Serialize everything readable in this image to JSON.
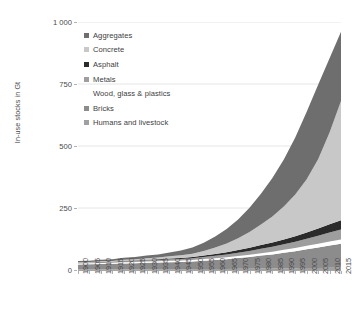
{
  "chart_data": {
    "type": "area",
    "stacked": true,
    "title": "",
    "xlabel": "",
    "ylabel": "In-use stocks in Gt",
    "ylim": [
      0,
      1000
    ],
    "yticks": [
      0,
      250,
      500,
      750,
      1000
    ],
    "ytick_labels": [
      "0",
      "250",
      "500",
      "750",
      "1 000"
    ],
    "grid": true,
    "legend_position": "upper-left-inside",
    "x": [
      1900,
      1905,
      1910,
      1915,
      1920,
      1925,
      1930,
      1935,
      1940,
      1945,
      1950,
      1955,
      1960,
      1965,
      1970,
      1975,
      1980,
      1985,
      1990,
      1995,
      2000,
      2005,
      2010,
      2015
    ],
    "xtick_labels": [
      "1900",
      "1905",
      "1910",
      "1915",
      "1920",
      "1925",
      "1930",
      "1935",
      "1940",
      "1945",
      "1950",
      "1955",
      "1960",
      "1965",
      "1970",
      "1975",
      "1980",
      "1985",
      "1990",
      "1995",
      "2000",
      "2005",
      "2010",
      "2015"
    ],
    "series": [
      {
        "name": "Humans and livestock",
        "color": "#a0a0a0",
        "values": [
          2,
          2,
          2,
          2,
          2,
          2,
          3,
          3,
          3,
          3,
          3,
          4,
          4,
          4,
          5,
          5,
          6,
          6,
          7,
          7,
          8,
          8,
          9,
          9
        ]
      },
      {
        "name": "Bricks",
        "color": "#8c8c8c",
        "values": [
          20,
          21,
          22,
          23,
          24,
          25,
          26,
          27,
          28,
          29,
          31,
          33,
          36,
          39,
          43,
          47,
          52,
          57,
          63,
          69,
          76,
          83,
          90,
          97
        ]
      },
      {
        "name": "Wood, glass & plastics",
        "color": "#ffffff",
        "values": [
          4,
          4,
          4,
          4,
          5,
          5,
          5,
          5,
          6,
          6,
          6,
          7,
          7,
          8,
          8,
          9,
          10,
          11,
          12,
          13,
          14,
          15,
          16,
          17
        ]
      },
      {
        "name": "Metals",
        "color": "#9e9e9e",
        "values": [
          2,
          2,
          3,
          3,
          4,
          4,
          5,
          5,
          6,
          6,
          7,
          8,
          10,
          12,
          14,
          16,
          18,
          20,
          22,
          25,
          28,
          32,
          36,
          40
        ]
      },
      {
        "name": "Asphalt",
        "color": "#2b2b2b",
        "values": [
          1,
          1,
          1,
          1,
          2,
          2,
          2,
          3,
          3,
          4,
          5,
          6,
          8,
          9,
          11,
          13,
          15,
          17,
          19,
          22,
          25,
          29,
          33,
          38
        ]
      },
      {
        "name": "Concrete",
        "color": "#c8c8c8",
        "values": [
          2,
          2,
          3,
          3,
          4,
          5,
          6,
          7,
          9,
          11,
          14,
          19,
          26,
          35,
          47,
          63,
          82,
          105,
          133,
          168,
          215,
          280,
          370,
          480
        ]
      },
      {
        "name": "Aggregates",
        "color": "#6e6e6e",
        "values": [
          5,
          5,
          6,
          7,
          8,
          9,
          11,
          13,
          16,
          20,
          25,
          33,
          44,
          58,
          76,
          98,
          124,
          155,
          190,
          230,
          272,
          300,
          300,
          280
        ]
      }
    ],
    "legend_entries": [
      {
        "label": "Aggregates",
        "color": "#6e6e6e",
        "marker": true
      },
      {
        "label": "Concrete",
        "color": "#c8c8c8",
        "marker": true
      },
      {
        "label": "Asphalt",
        "color": "#2b2b2b",
        "marker": true
      },
      {
        "label": "Metals",
        "color": "#9e9e9e",
        "marker": true
      },
      {
        "label": "Wood, glass & plastics",
        "color": "#ffffff",
        "marker": false
      },
      {
        "label": "Bricks",
        "color": "#8c8c8c",
        "marker": true
      },
      {
        "label": "Humans and livestock",
        "color": "#a0a0a0",
        "marker": true
      }
    ]
  }
}
